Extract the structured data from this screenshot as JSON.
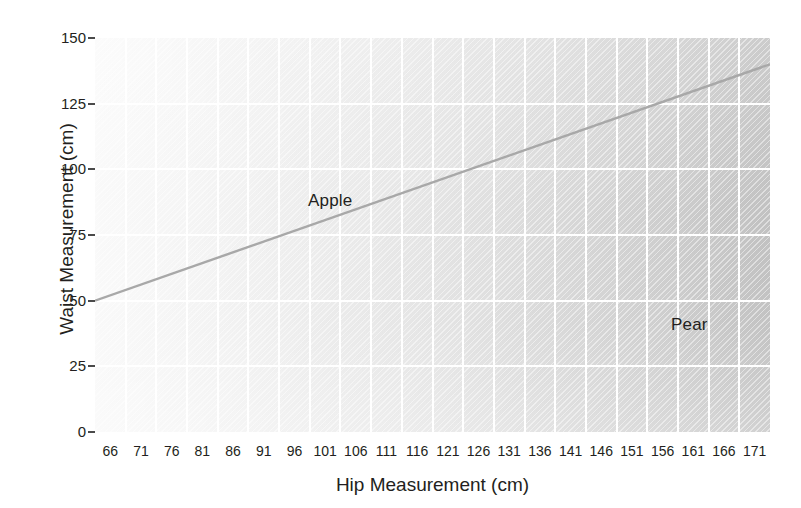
{
  "chart_data": {
    "type": "line",
    "title": "",
    "xlabel": "Hip Measurement (cm)",
    "ylabel": "Waist Measurement (cm)",
    "xlim": [
      63.5,
      173.5
    ],
    "ylim": [
      0,
      150
    ],
    "grid": true,
    "legend_position": "none",
    "x_tick_labels": [
      "66",
      "71",
      "76",
      "81",
      "86",
      "91",
      "96",
      "101",
      "106",
      "111",
      "116",
      "121",
      "126",
      "131",
      "136",
      "141",
      "146",
      "151",
      "156",
      "161",
      "166",
      "171"
    ],
    "y_tick_labels": [
      "0",
      "25",
      "50",
      "75",
      "100",
      "125",
      "150"
    ],
    "y_ticks": [
      0,
      25,
      50,
      75,
      100,
      125,
      150
    ],
    "series": [
      {
        "name": "waist-to-hip ratio boundary",
        "x": [
          63.5,
          173.5
        ],
        "values": [
          50,
          140
        ]
      }
    ],
    "annotations": [
      {
        "text": "Apple",
        "x": 84,
        "y": 108,
        "region": "above-line"
      },
      {
        "text": "Pear",
        "x": 139,
        "y": 81,
        "region": "below-line"
      }
    ]
  },
  "axes": {
    "y_title": "Waist Measurement (cm)",
    "x_title": "Hip Measurement (cm)",
    "y_ticks": [
      "150",
      "125",
      "100",
      "75",
      "50",
      "25",
      "0"
    ],
    "x_ticks": [
      "66",
      "71",
      "76",
      "81",
      "86",
      "91",
      "96",
      "101",
      "106",
      "111",
      "116",
      "121",
      "126",
      "131",
      "136",
      "141",
      "146",
      "151",
      "156",
      "161",
      "166",
      "171"
    ]
  },
  "regions": {
    "apple_label": "Apple",
    "pear_label": "Pear"
  },
  "colors": {
    "line": "#a8a8a8",
    "grid": "#ffffff",
    "text": "#231f20",
    "plot_light": "#f6f6f6",
    "plot_dark": "#c2c2c2",
    "page_background": "#ffffff"
  }
}
